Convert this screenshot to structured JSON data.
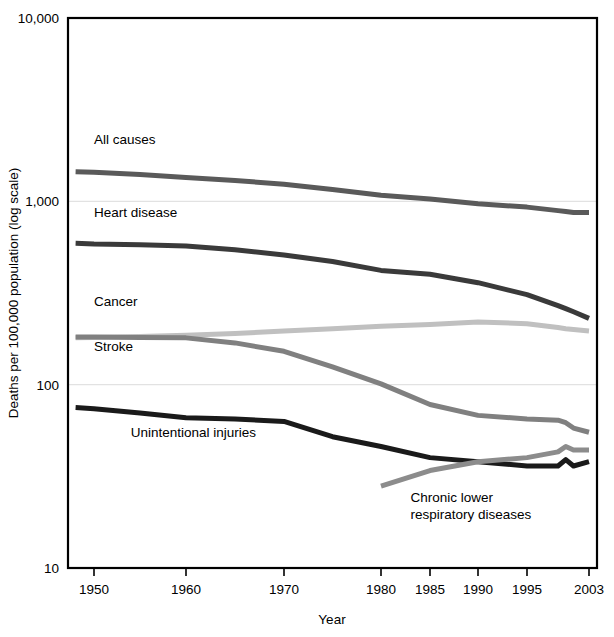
{
  "chart_data": {
    "type": "line",
    "title": "",
    "xlabel": "Year",
    "ylabel": "Deaths per 100,000 population (log scale)",
    "yscale": "log",
    "ylim": [
      10,
      10000
    ],
    "ytick_labels": [
      "10,000",
      "1,000",
      "100",
      "10"
    ],
    "ytick_values": [
      10000,
      1000,
      100,
      10
    ],
    "xtick_labels": [
      "1950",
      "1960",
      "1970",
      "1980",
      "1985",
      "1990",
      "1995",
      "2003"
    ],
    "xtick_values": [
      1950,
      1960,
      1970,
      1980,
      1985,
      1990,
      1995,
      2003
    ],
    "grid": "horizontal-major",
    "legend": "inline-series-labels",
    "x": [
      1948,
      1950,
      1955,
      1960,
      1965,
      1970,
      1975,
      1980,
      1985,
      1990,
      1995,
      1999,
      2000,
      2001,
      2003
    ],
    "series": [
      {
        "name": "All causes",
        "color": "#5a5a5a",
        "label_x": 1950,
        "label_value": 2050,
        "values": [
          1450,
          1440,
          1400,
          1350,
          1300,
          1240,
          1160,
          1080,
          1030,
          970,
          930,
          890,
          880,
          870,
          870
        ]
      },
      {
        "name": "Heart disease",
        "color": "#3a3a3a",
        "label_x": 1950,
        "label_value": 820,
        "values": [
          590,
          585,
          580,
          570,
          545,
          510,
          470,
          420,
          400,
          360,
          310,
          270,
          260,
          250,
          230
        ]
      },
      {
        "name": "Cancer",
        "color": "#c0c0c0",
        "label_x": 1950,
        "label_value": 270,
        "values": [
          180,
          181,
          183,
          186,
          190,
          196,
          202,
          208,
          213,
          220,
          215,
          205,
          202,
          200,
          196
        ]
      },
      {
        "name": "Stroke",
        "color": "#808080",
        "label_x": 1950,
        "label_value": 152,
        "values": [
          182,
          182,
          181,
          180,
          169,
          152,
          125,
          101,
          78,
          68,
          65,
          64,
          62,
          58,
          55
        ]
      },
      {
        "name": "Unintentional injuries",
        "color": "#1a1a1a",
        "label_x": 1954,
        "label_value": 52,
        "values": [
          75,
          74,
          70,
          66,
          65,
          63,
          52,
          46,
          40,
          38,
          36,
          36,
          39,
          36,
          38
        ]
      },
      {
        "name": "Chronic lower respiratory diseases",
        "color": "#8c8c8c",
        "label_x": 1983,
        "label_value": 23,
        "start_x": 1980,
        "values": [
          null,
          null,
          null,
          null,
          null,
          null,
          null,
          28,
          34,
          38,
          40,
          43,
          46,
          44,
          44
        ]
      }
    ]
  },
  "axes": {
    "x_axis_title": "Year",
    "y_axis_title": "Deaths per 100,000 population (log scale)"
  }
}
